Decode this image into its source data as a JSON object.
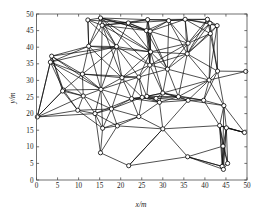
{
  "figure": {
    "kind": "network-topology-scatter-plot",
    "background_color": "#ffffff",
    "line_color": "#0c0c0c",
    "axis_color": "#4d4d4d",
    "marker_face_color": "#ffffff"
  },
  "chart_data": {
    "type": "scatter",
    "title": "",
    "subtitle": "",
    "xlabel": "x/m",
    "ylabel": "y/m",
    "xlim": [
      0,
      50
    ],
    "ylim": [
      0,
      50
    ],
    "xticks": [
      0,
      5,
      10,
      15,
      20,
      25,
      30,
      35,
      40,
      45,
      50
    ],
    "yticks": [
      0,
      5,
      10,
      15,
      20,
      25,
      30,
      35,
      40,
      45,
      50
    ],
    "xticklabels": [
      "0",
      "5",
      "10",
      "15",
      "20",
      "25",
      "30",
      "35",
      "40",
      "45",
      "50"
    ],
    "yticklabels": [
      "0",
      "5",
      "10",
      "15",
      "20",
      "25",
      "30",
      "35",
      "40",
      "45",
      "50"
    ],
    "grid": false,
    "legend": null,
    "annotations": [],
    "marker": "circle",
    "marker_size": 2.1,
    "node_count": 60,
    "edge_count": 196,
    "nodes": [
      {
        "id": 0,
        "x": 0.2,
        "y": 19.0
      },
      {
        "id": 1,
        "x": 3.6,
        "y": 37.3
      },
      {
        "id": 2,
        "x": 3.3,
        "y": 35.5
      },
      {
        "id": 3,
        "x": 6.4,
        "y": 27.1
      },
      {
        "id": 4,
        "x": 10.9,
        "y": 31.9
      },
      {
        "id": 5,
        "x": 12.4,
        "y": 40.3
      },
      {
        "id": 6,
        "x": 12.2,
        "y": 48.2
      },
      {
        "id": 7,
        "x": 15.2,
        "y": 48.8
      },
      {
        "id": 8,
        "x": 15.6,
        "y": 46.6
      },
      {
        "id": 9,
        "x": 19.0,
        "y": 40.2
      },
      {
        "id": 10,
        "x": 21.8,
        "y": 47.3
      },
      {
        "id": 11,
        "x": 26.4,
        "y": 48.3
      },
      {
        "id": 12,
        "x": 26.1,
        "y": 45.0
      },
      {
        "id": 13,
        "x": 27.0,
        "y": 44.8
      },
      {
        "id": 14,
        "x": 31.4,
        "y": 48.0
      },
      {
        "id": 15,
        "x": 35.3,
        "y": 48.4
      },
      {
        "id": 16,
        "x": 40.6,
        "y": 48.4
      },
      {
        "id": 17,
        "x": 41.2,
        "y": 47.2
      },
      {
        "id": 18,
        "x": 42.9,
        "y": 46.5
      },
      {
        "id": 19,
        "x": 41.3,
        "y": 44.1
      },
      {
        "id": 20,
        "x": 36.0,
        "y": 41.2
      },
      {
        "id": 21,
        "x": 35.8,
        "y": 38.0
      },
      {
        "id": 22,
        "x": 27.1,
        "y": 38.6
      },
      {
        "id": 23,
        "x": 26.9,
        "y": 34.6
      },
      {
        "id": 24,
        "x": 31.1,
        "y": 33.4
      },
      {
        "id": 25,
        "x": 24.3,
        "y": 31.0
      },
      {
        "id": 26,
        "x": 20.3,
        "y": 30.8
      },
      {
        "id": 27,
        "x": 15.3,
        "y": 27.3
      },
      {
        "id": 28,
        "x": 11.1,
        "y": 25.3
      },
      {
        "id": 29,
        "x": 6.2,
        "y": 26.8
      },
      {
        "id": 30,
        "x": 9.8,
        "y": 21.0
      },
      {
        "id": 31,
        "x": 13.9,
        "y": 20.0
      },
      {
        "id": 32,
        "x": 17.8,
        "y": 21.4
      },
      {
        "id": 33,
        "x": 22.6,
        "y": 24.5
      },
      {
        "id": 34,
        "x": 25.1,
        "y": 24.9
      },
      {
        "id": 35,
        "x": 26.2,
        "y": 25.2
      },
      {
        "id": 36,
        "x": 28.4,
        "y": 24.6
      },
      {
        "id": 37,
        "x": 29.2,
        "y": 23.4
      },
      {
        "id": 38,
        "x": 30.0,
        "y": 26.2
      },
      {
        "id": 39,
        "x": 33.7,
        "y": 25.1
      },
      {
        "id": 40,
        "x": 36.0,
        "y": 24.0
      },
      {
        "id": 41,
        "x": 39.7,
        "y": 24.0
      },
      {
        "id": 42,
        "x": 41.0,
        "y": 30.1
      },
      {
        "id": 43,
        "x": 43.0,
        "y": 32.8
      },
      {
        "id": 44,
        "x": 49.7,
        "y": 32.7
      },
      {
        "id": 45,
        "x": 44.5,
        "y": 22.4
      },
      {
        "id": 46,
        "x": 43.5,
        "y": 16.4
      },
      {
        "id": 47,
        "x": 45.1,
        "y": 15.7
      },
      {
        "id": 48,
        "x": 49.4,
        "y": 14.3
      },
      {
        "id": 49,
        "x": 44.3,
        "y": 10.2
      },
      {
        "id": 50,
        "x": 44.1,
        "y": 4.1
      },
      {
        "id": 51,
        "x": 44.4,
        "y": 3.2
      },
      {
        "id": 52,
        "x": 45.4,
        "y": 5.0
      },
      {
        "id": 53,
        "x": 35.9,
        "y": 7.0
      },
      {
        "id": 54,
        "x": 30.0,
        "y": 15.4
      },
      {
        "id": 55,
        "x": 21.9,
        "y": 4.3
      },
      {
        "id": 56,
        "x": 15.2,
        "y": 8.2
      },
      {
        "id": 57,
        "x": 15.7,
        "y": 15.6
      },
      {
        "id": 58,
        "x": 19.2,
        "y": 16.3
      },
      {
        "id": 59,
        "x": 24.3,
        "y": 19.1
      }
    ],
    "edges": [
      [
        0,
        1
      ],
      [
        0,
        2
      ],
      [
        0,
        3
      ],
      [
        0,
        29
      ],
      [
        0,
        30
      ],
      [
        0,
        31
      ],
      [
        0,
        28
      ],
      [
        1,
        2
      ],
      [
        1,
        3
      ],
      [
        1,
        4
      ],
      [
        1,
        5
      ],
      [
        1,
        9
      ],
      [
        1,
        29
      ],
      [
        1,
        27
      ],
      [
        2,
        3
      ],
      [
        2,
        4
      ],
      [
        2,
        5
      ],
      [
        2,
        9
      ],
      [
        2,
        27
      ],
      [
        2,
        28
      ],
      [
        3,
        4
      ],
      [
        3,
        28
      ],
      [
        3,
        29
      ],
      [
        3,
        30
      ],
      [
        3,
        27
      ],
      [
        4,
        5
      ],
      [
        4,
        9
      ],
      [
        4,
        27
      ],
      [
        4,
        26
      ],
      [
        4,
        28
      ],
      [
        4,
        25
      ],
      [
        5,
        6
      ],
      [
        5,
        7
      ],
      [
        5,
        8
      ],
      [
        5,
        9
      ],
      [
        5,
        22
      ],
      [
        5,
        26
      ],
      [
        5,
        27
      ],
      [
        6,
        7
      ],
      [
        6,
        8
      ],
      [
        6,
        9
      ],
      [
        6,
        10
      ],
      [
        6,
        5
      ],
      [
        7,
        8
      ],
      [
        7,
        9
      ],
      [
        7,
        10
      ],
      [
        7,
        11
      ],
      [
        7,
        12
      ],
      [
        7,
        13
      ],
      [
        7,
        22
      ],
      [
        7,
        23
      ],
      [
        8,
        9
      ],
      [
        8,
        10
      ],
      [
        8,
        11
      ],
      [
        8,
        12
      ],
      [
        8,
        22
      ],
      [
        8,
        26
      ],
      [
        8,
        27
      ],
      [
        9,
        10
      ],
      [
        9,
        22
      ],
      [
        9,
        23
      ],
      [
        9,
        26
      ],
      [
        9,
        25
      ],
      [
        9,
        27
      ],
      [
        10,
        11
      ],
      [
        10,
        12
      ],
      [
        10,
        13
      ],
      [
        10,
        14
      ],
      [
        10,
        22
      ],
      [
        11,
        12
      ],
      [
        11,
        13
      ],
      [
        11,
        14
      ],
      [
        11,
        15
      ],
      [
        11,
        22
      ],
      [
        11,
        23
      ],
      [
        12,
        13
      ],
      [
        12,
        14
      ],
      [
        12,
        22
      ],
      [
        12,
        23
      ],
      [
        12,
        24
      ],
      [
        13,
        14
      ],
      [
        13,
        15
      ],
      [
        13,
        20
      ],
      [
        13,
        22
      ],
      [
        13,
        23
      ],
      [
        13,
        24
      ],
      [
        14,
        15
      ],
      [
        14,
        16
      ],
      [
        14,
        20
      ],
      [
        14,
        21
      ],
      [
        14,
        24
      ],
      [
        15,
        16
      ],
      [
        15,
        17
      ],
      [
        15,
        18
      ],
      [
        15,
        19
      ],
      [
        15,
        20
      ],
      [
        15,
        21
      ],
      [
        16,
        17
      ],
      [
        16,
        18
      ],
      [
        16,
        19
      ],
      [
        16,
        20
      ],
      [
        16,
        21
      ],
      [
        17,
        18
      ],
      [
        17,
        19
      ],
      [
        17,
        20
      ],
      [
        17,
        21
      ],
      [
        17,
        43
      ],
      [
        18,
        19
      ],
      [
        18,
        21
      ],
      [
        18,
        42
      ],
      [
        18,
        43
      ],
      [
        19,
        20
      ],
      [
        19,
        21
      ],
      [
        19,
        42
      ],
      [
        19,
        43
      ],
      [
        20,
        21
      ],
      [
        20,
        22
      ],
      [
        20,
        24
      ],
      [
        20,
        23
      ],
      [
        21,
        22
      ],
      [
        21,
        23
      ],
      [
        21,
        24
      ],
      [
        21,
        42
      ],
      [
        21,
        39
      ],
      [
        21,
        43
      ],
      [
        22,
        23
      ],
      [
        22,
        24
      ],
      [
        22,
        25
      ],
      [
        22,
        26
      ],
      [
        22,
        38
      ],
      [
        23,
        24
      ],
      [
        23,
        25
      ],
      [
        23,
        26
      ],
      [
        23,
        35
      ],
      [
        23,
        38
      ],
      [
        24,
        25
      ],
      [
        24,
        38
      ],
      [
        24,
        39
      ],
      [
        24,
        42
      ],
      [
        25,
        26
      ],
      [
        25,
        33
      ],
      [
        25,
        34
      ],
      [
        25,
        35
      ],
      [
        25,
        27
      ],
      [
        26,
        27
      ],
      [
        26,
        32
      ],
      [
        26,
        33
      ],
      [
        26,
        34
      ],
      [
        27,
        28
      ],
      [
        27,
        31
      ],
      [
        27,
        32
      ],
      [
        27,
        33
      ],
      [
        27,
        57
      ],
      [
        28,
        29
      ],
      [
        28,
        30
      ],
      [
        28,
        31
      ],
      [
        28,
        32
      ],
      [
        29,
        30
      ],
      [
        29,
        3
      ],
      [
        30,
        31
      ],
      [
        30,
        32
      ],
      [
        30,
        57
      ],
      [
        31,
        32
      ],
      [
        31,
        33
      ],
      [
        31,
        57
      ],
      [
        31,
        58
      ],
      [
        32,
        33
      ],
      [
        32,
        34
      ],
      [
        32,
        57
      ],
      [
        32,
        58
      ],
      [
        32,
        59
      ],
      [
        33,
        34
      ],
      [
        33,
        35
      ],
      [
        33,
        36
      ],
      [
        33,
        37
      ],
      [
        33,
        59
      ],
      [
        34,
        35
      ],
      [
        34,
        36
      ],
      [
        34,
        37
      ],
      [
        34,
        38
      ],
      [
        34,
        59
      ],
      [
        35,
        36
      ],
      [
        35,
        37
      ],
      [
        35,
        38
      ],
      [
        35,
        39
      ],
      [
        36,
        37
      ],
      [
        36,
        38
      ],
      [
        36,
        39
      ],
      [
        36,
        40
      ],
      [
        37,
        38
      ],
      [
        37,
        39
      ],
      [
        37,
        40
      ],
      [
        37,
        54
      ],
      [
        37,
        59
      ],
      [
        38,
        39
      ],
      [
        38,
        40
      ],
      [
        38,
        41
      ],
      [
        38,
        42
      ],
      [
        39,
        40
      ],
      [
        39,
        41
      ],
      [
        39,
        42
      ],
      [
        40,
        41
      ],
      [
        40,
        42
      ],
      [
        40,
        45
      ],
      [
        40,
        54
      ],
      [
        41,
        42
      ],
      [
        41,
        43
      ],
      [
        41,
        45
      ],
      [
        41,
        46
      ],
      [
        42,
        43
      ],
      [
        42,
        45
      ],
      [
        42,
        44
      ],
      [
        43,
        44
      ],
      [
        43,
        45
      ],
      [
        45,
        46
      ],
      [
        45,
        47
      ],
      [
        45,
        48
      ],
      [
        45,
        49
      ],
      [
        46,
        47
      ],
      [
        46,
        48
      ],
      [
        46,
        49
      ],
      [
        46,
        50
      ],
      [
        46,
        51
      ],
      [
        46,
        52
      ],
      [
        46,
        54
      ],
      [
        47,
        48
      ],
      [
        47,
        49
      ],
      [
        47,
        50
      ],
      [
        47,
        51
      ],
      [
        47,
        52
      ],
      [
        48,
        47
      ],
      [
        48,
        46
      ],
      [
        49,
        50
      ],
      [
        49,
        51
      ],
      [
        49,
        52
      ],
      [
        49,
        53
      ],
      [
        50,
        51
      ],
      [
        50,
        52
      ],
      [
        50,
        53
      ],
      [
        51,
        52
      ],
      [
        51,
        53
      ],
      [
        53,
        54
      ],
      [
        53,
        55
      ],
      [
        53,
        50
      ],
      [
        54,
        55
      ],
      [
        54,
        58
      ],
      [
        54,
        59
      ],
      [
        55,
        56
      ],
      [
        55,
        54
      ],
      [
        56,
        57
      ],
      [
        56,
        58
      ],
      [
        56,
        31
      ],
      [
        57,
        58
      ],
      [
        57,
        59
      ],
      [
        58,
        59
      ]
    ]
  }
}
